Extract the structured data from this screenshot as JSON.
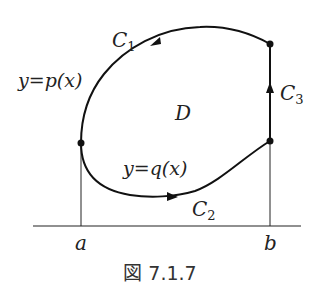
{
  "figure": {
    "caption": "図 7.1.7",
    "region_label": "D",
    "curves": [
      {
        "id": "C1",
        "name": "C",
        "sub": "1",
        "equation": "y=p(x)",
        "direction": "counterclockwise (right to left along top)"
      },
      {
        "id": "C2",
        "name": "C",
        "sub": "2",
        "equation": "y=q(x)",
        "direction": "left to right along bottom"
      },
      {
        "id": "C3",
        "name": "C",
        "sub": "3",
        "direction": "upward along x=b"
      }
    ],
    "axis_labels": {
      "a": "a",
      "b": "b"
    },
    "equations": {
      "upper": "y=p(x)",
      "lower": "y=q(x)"
    }
  },
  "colors": {
    "stroke": "#111111",
    "text": "#222222"
  }
}
